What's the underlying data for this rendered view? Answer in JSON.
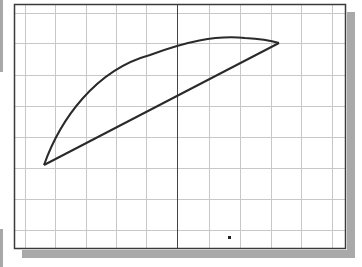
{
  "sketch": {
    "frame": {
      "left": 14,
      "top": 4,
      "right": 346,
      "bottom": 249,
      "color": "#3a3a3a"
    },
    "shadow": {
      "color": "#a9a9a9",
      "offset": 7
    },
    "grid": {
      "color": "#c8c8c8",
      "vertical_lines_x": [
        25,
        55,
        86,
        116,
        146,
        209,
        240,
        271,
        301,
        332
      ],
      "horizontal_lines_y": [
        13,
        43,
        75,
        106,
        137,
        168,
        199,
        230
      ],
      "axis_x": 177,
      "axis_color": "#444444"
    },
    "profile": {
      "stroke_color": "#2a2a2a",
      "arc_start": [
        44,
        165
      ],
      "arc_end": [
        279,
        43
      ],
      "arc_path": "M44,165 C60,120 95,70 150,55 C185,42 215,35 245,38 C262,39 272,41 279,43",
      "line_start": [
        44,
        165
      ],
      "line_end": [
        279,
        43
      ]
    },
    "point_marker": {
      "x": 229,
      "y": 237,
      "size": 3,
      "color": "#222222"
    },
    "left_edge_bars": [
      {
        "top": 0,
        "height": 72
      },
      {
        "top": 229,
        "height": 38
      }
    ]
  }
}
